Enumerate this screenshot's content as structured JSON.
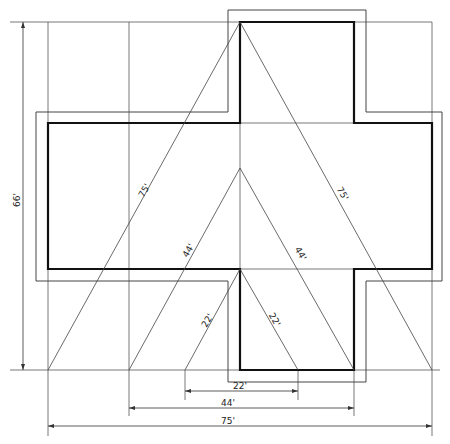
{
  "diagram": {
    "labels": {
      "height_dim": "66'",
      "diag_large_left": "75'",
      "diag_large_right": "75'",
      "diag_mid_left": "44'",
      "diag_mid_right": "44'",
      "diag_small_left": "22'",
      "diag_small_right": "22'",
      "base_small": "22'",
      "base_mid": "44'",
      "base_large": "75'"
    },
    "colors": {
      "background": "#ffffff",
      "line": "#444444",
      "outline": "#111111"
    }
  }
}
